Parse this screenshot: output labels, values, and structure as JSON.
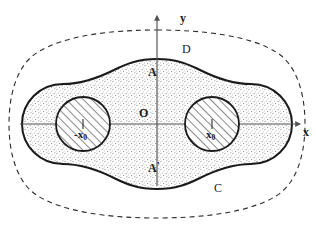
{
  "figure": {
    "type": "math-diagram",
    "width": 316,
    "height": 227,
    "background": "#ffffff"
  },
  "axes": {
    "x_label": "x",
    "y_label": "y",
    "origin_label": "O",
    "x_axis": {
      "x_start": 20,
      "x_end": 305,
      "y": 124,
      "arrow": "right"
    },
    "y_axis": {
      "x": 157,
      "y_start": 14,
      "y_end": 186,
      "arrow": "up"
    },
    "axis_color": "#555555"
  },
  "labels": {
    "upper_intersection": "A",
    "lower_intersection": "A",
    "lower_intersection_prime": "'",
    "outer_region": "D",
    "boundary_curve": "C",
    "left_point_sign": "-",
    "left_point_base": "x",
    "left_point_sub": "0",
    "right_point_base": "x",
    "right_point_sub": "0"
  },
  "geometry": {
    "dashed_outline": {
      "name": "outer-dashed-boundary",
      "stroke": "#2b2b2b",
      "stroke_width": 1.1,
      "dash": "5,4"
    },
    "solid_outline": {
      "name": "inner-solid-dumbbell-boundary",
      "stroke": "#1a1a1a",
      "stroke_width": 2.0,
      "fill": "#ffffff"
    },
    "stipple_fill": {
      "name": "stippled-region",
      "color": "#6e6e6e",
      "density": "fine-dots"
    },
    "left_disk": {
      "name": "left-hatched-disk",
      "cx": 83,
      "cy": 124,
      "r": 27,
      "stroke": "#1a1a1a",
      "stroke_width": 1.8,
      "hatch_angle_deg": 45
    },
    "right_disk": {
      "name": "right-hatched-disk",
      "cx": 212,
      "cy": 124,
      "r": 27,
      "stroke": "#1a1a1a",
      "stroke_width": 1.8,
      "hatch_angle_deg": 45
    }
  },
  "colors": {
    "ink": "#1a1a1a",
    "axis": "#555555",
    "stipple": "#6e6e6e",
    "hatch": "#333333",
    "paper": "#ffffff"
  }
}
